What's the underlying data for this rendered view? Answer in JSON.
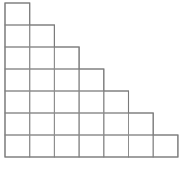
{
  "figure": {
    "name": "staircase-grid",
    "title": "",
    "background_color": "#ffffff",
    "line_color": "#8d8d8d",
    "outline_color": "#7a7a7a",
    "line_width": 1,
    "rows": 7,
    "columns": 7,
    "total_cells": 28,
    "cells_per_row": [
      1,
      2,
      3,
      4,
      5,
      6,
      7
    ],
    "alignment": "left",
    "origin_x": 5,
    "origin_y": 3,
    "cell_width": 24.7,
    "cell_height": 22,
    "grid_width": 173,
    "grid_height": 154
  },
  "chart_data": {
    "type": "bar",
    "title": "",
    "xlabel": "",
    "ylabel": "",
    "categories": [
      "1",
      "2",
      "3",
      "4",
      "5",
      "6",
      "7"
    ],
    "values": [
      1,
      2,
      3,
      4,
      5,
      6,
      7
    ],
    "ylim": [
      0,
      7
    ],
    "grid": true,
    "legend": "none"
  }
}
